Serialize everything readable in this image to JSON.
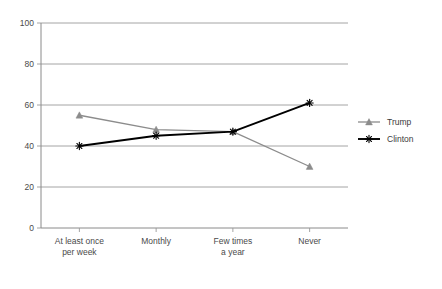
{
  "chart_data": {
    "type": "line",
    "title": "",
    "subtitle": "",
    "xlabel": "",
    "ylabel": "",
    "categories": [
      "At least once per week",
      "Monthly",
      "Few times a year",
      "Never"
    ],
    "category_lines": [
      [
        "At least once",
        "per week"
      ],
      [
        "Monthly",
        ""
      ],
      [
        "Few times",
        "a year"
      ],
      [
        "Never",
        ""
      ]
    ],
    "series": [
      {
        "name": "Trump",
        "values": [
          55,
          48,
          47,
          30
        ],
        "color": "#8c8c8c",
        "marker": "triangle"
      },
      {
        "name": "Clinton",
        "values": [
          40,
          45,
          47,
          61
        ],
        "color": "#000000",
        "marker": "asterisk"
      }
    ],
    "ylim": [
      0,
      100
    ],
    "yticks": [
      0,
      20,
      40,
      60,
      80,
      100
    ],
    "ytick_labels": [
      "0",
      "20",
      "40",
      "60",
      "80",
      "100"
    ],
    "grid": true,
    "grid_axis": "y",
    "legend_position": "right"
  },
  "legend": {
    "entries": [
      {
        "label": "Trump",
        "color": "#8c8c8c",
        "marker": "triangle"
      },
      {
        "label": "Clinton",
        "color": "#000000",
        "marker": "asterisk"
      }
    ]
  }
}
